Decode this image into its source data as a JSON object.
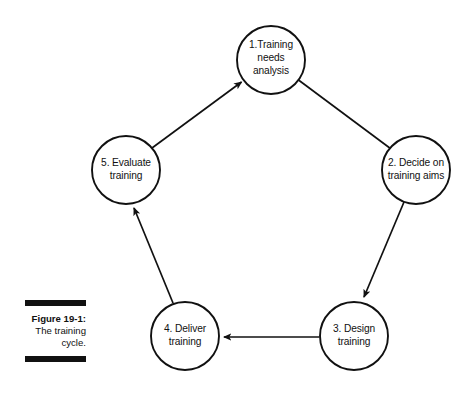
{
  "figure": {
    "caption_title": "Figure 19-1:",
    "caption_line_1": "The training",
    "caption_line_2": "cycle.",
    "rule_color": "#111111"
  },
  "diagram": {
    "type": "cycle",
    "shape": "pentagon",
    "node_radius": 34,
    "stroke_color": "#111111",
    "fill_color": "#ffffff",
    "background": "#ffffff",
    "nodes": [
      {
        "id": "node-1",
        "index": "1",
        "label": "1.Training needs analysis",
        "lines": [
          "1.Training",
          "needs",
          "analysis"
        ],
        "cx": 271,
        "cy": 60
      },
      {
        "id": "node-2",
        "index": "2",
        "label": "2. Decide on training aims",
        "lines": [
          "2. Decide on",
          "training aims"
        ],
        "cx": 416,
        "cy": 170
      },
      {
        "id": "node-3",
        "index": "3",
        "label": "3. Design training",
        "lines": [
          "3. Design",
          "training"
        ],
        "cx": 354,
        "cy": 336
      },
      {
        "id": "node-4",
        "index": "4",
        "label": "4. Deliver training",
        "lines": [
          "4. Deliver",
          "training"
        ],
        "cx": 185,
        "cy": 336
      },
      {
        "id": "node-5",
        "index": "5",
        "label": "5. Evaluate training",
        "lines": [
          "5. Evaluate",
          "training"
        ],
        "cx": 126,
        "cy": 170
      }
    ],
    "arrows": [
      {
        "id": "arrow-1-to-2",
        "from": "node-1",
        "to": "node-2"
      },
      {
        "id": "arrow-2-to-3",
        "from": "node-2",
        "to": "node-3"
      },
      {
        "id": "arrow-3-to-4",
        "from": "node-3",
        "to": "node-4"
      },
      {
        "id": "arrow-4-to-5",
        "from": "node-4",
        "to": "node-5"
      },
      {
        "id": "arrow-5-to-1",
        "from": "node-5",
        "to": "node-1"
      }
    ]
  }
}
